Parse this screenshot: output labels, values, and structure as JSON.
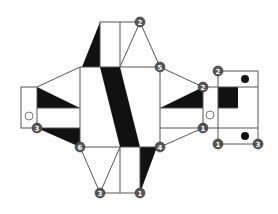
{
  "diagram": {
    "type": "folding-net",
    "nodes": [
      {
        "id": "n-top",
        "label": "2",
        "x": 140,
        "y": 22
      },
      {
        "id": "n-five",
        "label": "5",
        "x": 160,
        "y": 67
      },
      {
        "id": "n-right-upper",
        "label": "2",
        "x": 203,
        "y": 87
      },
      {
        "id": "n-right-lower",
        "label": "1",
        "x": 203,
        "y": 128
      },
      {
        "id": "n-four",
        "label": "4",
        "x": 160,
        "y": 147
      },
      {
        "id": "n-bottom-right",
        "label": "1",
        "x": 140,
        "y": 193
      },
      {
        "id": "n-bottom-left",
        "label": "3",
        "x": 100,
        "y": 193
      },
      {
        "id": "n-six",
        "label": "6",
        "x": 80,
        "y": 147
      },
      {
        "id": "n-left",
        "label": "3",
        "x": 37,
        "y": 128
      },
      {
        "id": "n-box-top",
        "label": "2",
        "x": 218,
        "y": 71
      },
      {
        "id": "n-box-bl",
        "label": "1",
        "x": 218,
        "y": 144
      },
      {
        "id": "n-box-br",
        "label": "3",
        "x": 258,
        "y": 144
      }
    ]
  }
}
